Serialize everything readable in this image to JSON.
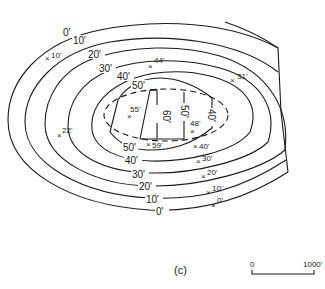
{
  "figure": {
    "caption": "(c)",
    "scale_bar": {
      "start_label": "0",
      "end_label": "1000'"
    }
  },
  "contours": {
    "c0": "0'",
    "c10": "10'",
    "c20": "20'",
    "c30": "30'",
    "c40": "40'",
    "c50": "50'",
    "c60": "60'",
    "c0_bottom": "0'",
    "c10_bottom": "10'",
    "c20_bottom": "20'",
    "c30_bottom": "30'",
    "c40_bottom": "40'",
    "c50_bottom": "50'",
    "c50_right": "50'",
    "c40_right": "40'"
  },
  "spot_heights": [
    {
      "label": "10'"
    },
    {
      "label": "44'"
    },
    {
      "label": "31'"
    },
    {
      "label": "55'"
    },
    {
      "label": "22'"
    },
    {
      "label": "48'"
    },
    {
      "label": "59'"
    },
    {
      "label": "40'"
    },
    {
      "label": "30'"
    },
    {
      "label": "20'"
    },
    {
      "label": "10'"
    },
    {
      "label": "0'"
    }
  ],
  "colors": {
    "ink": "#1a1a1a",
    "background": "#ffffff"
  }
}
